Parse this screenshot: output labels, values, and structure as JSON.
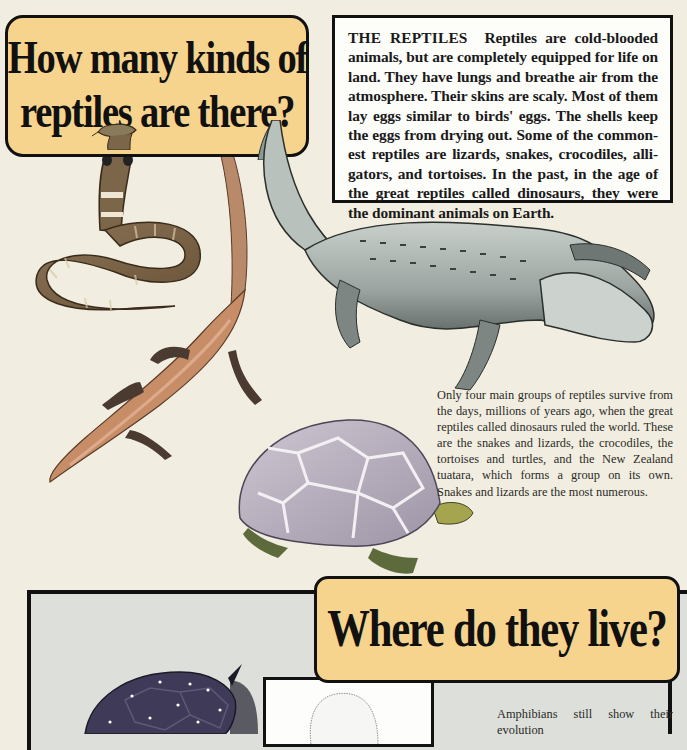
{
  "section1": {
    "title_line1": "How many kinds of",
    "title_line2": "reptiles are there?",
    "intro": {
      "lead": "THE REPTILES",
      "text": "Reptiles are cold-blooded animals, but are completely equipped for life on land. They have lungs and breathe air from the atmosphere. Their skins are scaly. Most of them lay eggs similar to birds' eggs. The shells keep the eggs from drying out. Some of the common-est reptiles are lizards, snakes, crocodiles, alli-gators, and tortoises. In the past, in the age of the great reptiles called dinosaurs, they were the dominant animals on Earth."
    },
    "body": "Only four main groups of reptiles survive from the days, millions of years ago, when the great reptiles called dinosaurs ruled the world. These are the snakes and lizards, the crocodiles, the tortoises and turtles, and the New Zealand tuatara, which forms a group on its own. Snakes and lizards are the most numerous.",
    "illustrations": [
      "cobra",
      "lizard",
      "alligator",
      "tortoise"
    ]
  },
  "section2": {
    "title": "Where do they live?",
    "body_start": "Amphibians still show their evolution",
    "illustrations": [
      "dark-shelled-turtle",
      "egg-sketch"
    ]
  },
  "colors": {
    "page_background": "#f1eee1",
    "title_box": "#f7d48d",
    "border": "#111111",
    "panel_background": "#dcdfda",
    "text_box": "#fdfdfa"
  }
}
